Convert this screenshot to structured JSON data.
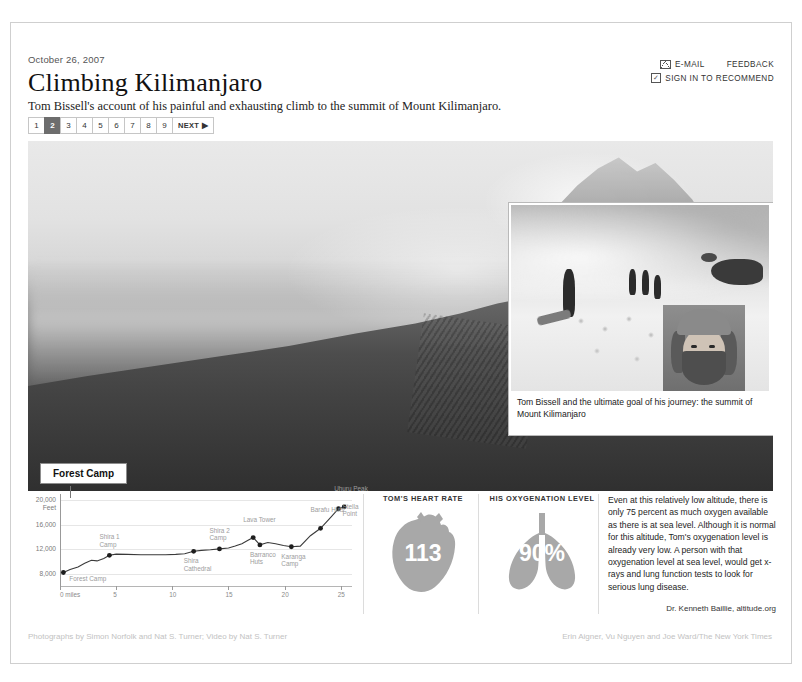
{
  "header": {
    "date": "October 26, 2007",
    "headline": "Climbing Kilimanjaro",
    "dek": "Tom Bissell's account of his painful and exhausting climb to the summit of Mount Kilimanjaro."
  },
  "utilities": {
    "email": "E-MAIL",
    "feedback": "FEEDBACK",
    "recommend": "SIGN IN TO RECOMMEND",
    "mail_icon": "envelope-icon",
    "check_icon": "checkbox-icon",
    "check_glyph": "✓"
  },
  "pagination": {
    "pages": [
      "1",
      "2",
      "3",
      "4",
      "5",
      "6",
      "7",
      "8",
      "9"
    ],
    "active": "2",
    "next_label": "NEXT ▶"
  },
  "stage": {
    "camp_tab": "Forest Camp",
    "inset_caption": "Tom Bissell and the ultimate goal of his journey: the summit of Mount Kilimanjaro"
  },
  "chart_data": {
    "type": "line",
    "title": "",
    "xlabel": "0 miles",
    "ylabel": "Feet",
    "xlim": [
      0,
      26
    ],
    "ylim": [
      6000,
      21000
    ],
    "grid": true,
    "ytick_labels": [
      "20,000",
      "16,000",
      "12,000",
      "8,000"
    ],
    "ytick_values": [
      20000,
      16000,
      12000,
      8000
    ],
    "yaxis_unit": "Feet",
    "xtick_labels": [
      "0 miles",
      "5",
      "10",
      "15",
      "20",
      "25"
    ],
    "xtick_values": [
      0,
      5,
      10,
      15,
      20,
      25
    ],
    "x": [
      0.3,
      0.9,
      1.6,
      2.2,
      2.8,
      3.3,
      3.9,
      4.4,
      5.0,
      6.0,
      7.2,
      8.4,
      9.4,
      10.3,
      11.1,
      11.9,
      12.6,
      13.4,
      14.2,
      15.0,
      15.6,
      16.2,
      16.7,
      17.2,
      17.8,
      18.5,
      19.2,
      19.9,
      20.6,
      21.4,
      22.3,
      23.2,
      24.1,
      24.8,
      25.3
    ],
    "y": [
      8200,
      8700,
      9100,
      9700,
      10200,
      10100,
      10500,
      11000,
      11200,
      11150,
      11100,
      11100,
      11100,
      11150,
      11250,
      11650,
      11800,
      11900,
      12050,
      12200,
      12500,
      12900,
      13400,
      13900,
      12700,
      13100,
      12900,
      12600,
      12400,
      12500,
      14200,
      15400,
      17200,
      18600,
      18900
    ],
    "markers": [
      {
        "label": "Forest Camp",
        "x": 0.3,
        "y": 8200,
        "label_pos": "below-right"
      },
      {
        "label": "Shira 1 Camp",
        "x": 4.4,
        "y": 11000,
        "label_pos": "above"
      },
      {
        "label": "Shira Cathedral",
        "x": 11.9,
        "y": 11650,
        "label_pos": "below"
      },
      {
        "label": "Shira 2 Camp",
        "x": 14.2,
        "y": 12050,
        "label_pos": "above"
      },
      {
        "label": "Lava Tower",
        "x": 17.2,
        "y": 13900,
        "label_pos": "above"
      },
      {
        "label": "Barranco Huts",
        "x": 17.8,
        "y": 12700,
        "label_pos": "below"
      },
      {
        "label": "Karanga Camp",
        "x": 20.6,
        "y": 12400,
        "label_pos": "below"
      },
      {
        "label": "Barafu Huts",
        "x": 23.2,
        "y": 15400,
        "label_pos": "above"
      },
      {
        "label": "Stella Point",
        "x": 24.8,
        "y": 18600,
        "label_pos": "right"
      },
      {
        "label": "Uhuru Peak",
        "x": 25.3,
        "y": 18900,
        "label_pos": "above"
      }
    ]
  },
  "stats": [
    {
      "title": "TOM'S HEART RATE",
      "value": "113",
      "icon": "heart-icon",
      "color": "#a8a8a8"
    },
    {
      "title": "HIS OXYGENATION LEVEL",
      "value": "90%",
      "icon": "lungs-icon",
      "color": "#a8a8a8"
    }
  ],
  "blurb": {
    "body": "Even at this relatively low altitude, there is only 75 percent as much oxygen available as there is at sea level. Although it is normal for this altitude, Tom's oxygenation level is already very low. A person with that oxygenation level at sea level, would get x-rays and lung function tests to look for serious lung disease.",
    "source": "Dr. Kenneth Baillie, altitude.org"
  },
  "credits": {
    "left": "Photographs by Simon Norfolk and Nat S. Turner; Video by Nat S. Turner",
    "right": "Erin Aigner, Vu Nguyen and Joe Ward/The New York Times"
  }
}
